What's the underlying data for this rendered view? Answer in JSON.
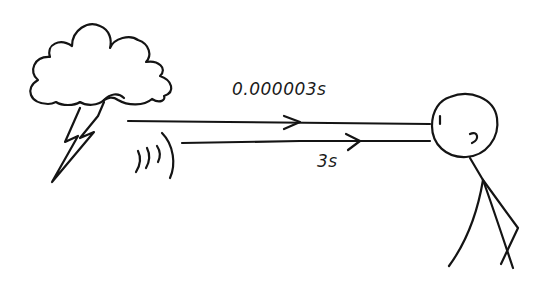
{
  "diagram": {
    "elements": {
      "cloud": {
        "icon": "cloud-icon"
      },
      "lightning": {
        "icon": "lightning-bolt-icon"
      },
      "sound_waves": {
        "icon": "sound-waves-icon"
      },
      "observer": {
        "icon": "stick-figure-icon"
      }
    },
    "arrows": [
      {
        "name": "light-path",
        "label": "0.000003s",
        "from": "lightning",
        "to": "observer-eye"
      },
      {
        "name": "sound-path",
        "label": "3s",
        "from": "sound-waves",
        "to": "observer-ear"
      }
    ],
    "stroke_color": "#141414",
    "background": "#ffffff"
  }
}
